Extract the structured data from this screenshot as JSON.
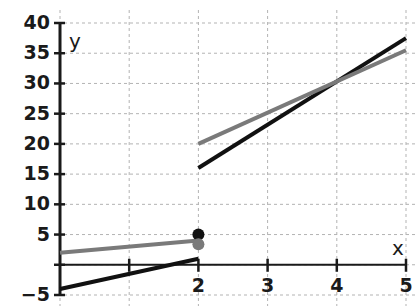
{
  "chart_data": {
    "type": "line",
    "title": "",
    "subtitle": "",
    "xlabel": "x",
    "ylabel": "y",
    "xlim": [
      0,
      5
    ],
    "ylim": [
      -5,
      40
    ],
    "x_ticks": [
      0,
      1,
      2,
      3,
      4,
      5
    ],
    "x_tick_labels": [
      "",
      "",
      "2",
      "3",
      "4",
      "5"
    ],
    "y_ticks": [
      -5,
      0,
      5,
      10,
      15,
      20,
      25,
      30,
      35,
      40
    ],
    "y_tick_labels": [
      "−5",
      "",
      "5",
      "10",
      "15",
      "20",
      "25",
      "30",
      "35",
      "40"
    ],
    "grid": true,
    "grid_style": "dashed",
    "grid_color": "#b3b3b3",
    "legend": "none",
    "axis_color": "#1a1a1a",
    "background": "#ffffff",
    "series": [
      {
        "name": "black-series",
        "color": "#111111",
        "width": 4,
        "segments": [
          {
            "name": "black-lower",
            "points": [
              [
                0,
                -4
              ],
              [
                2,
                1
              ]
            ]
          },
          {
            "name": "black-upper",
            "points": [
              [
                2,
                16
              ],
              [
                5,
                37.5
              ]
            ]
          }
        ],
        "markers": [
          {
            "name": "black-endpoint",
            "x": 2,
            "y": 5,
            "style": "filled-circle",
            "radius": 6
          }
        ]
      },
      {
        "name": "gray-series",
        "color": "#7a7a7a",
        "width": 4,
        "segments": [
          {
            "name": "gray-lower",
            "points": [
              [
                0,
                2
              ],
              [
                2,
                4
              ]
            ]
          },
          {
            "name": "gray-upper",
            "points": [
              [
                2,
                20
              ],
              [
                5,
                35.5
              ]
            ]
          }
        ],
        "markers": [
          {
            "name": "gray-endpoint",
            "x": 2,
            "y": 3.4,
            "style": "filled-circle",
            "radius": 6
          }
        ]
      }
    ],
    "annotations": [
      {
        "name": "intersection",
        "x": 4,
        "y": 30,
        "text": ""
      }
    ]
  },
  "axis_labels": {
    "x": "x",
    "y": "y"
  }
}
